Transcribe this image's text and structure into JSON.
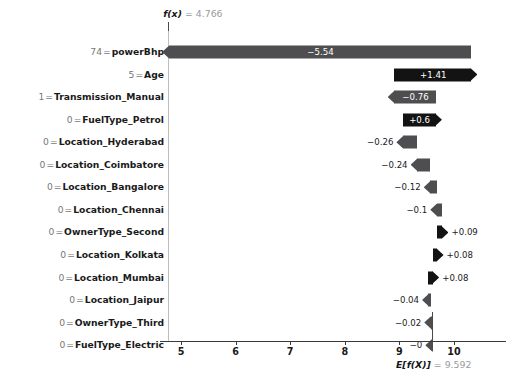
{
  "chart_data": {
    "type": "bar",
    "plot_kind": "shap-waterfall",
    "title": "",
    "xlabel": "",
    "ylabel": "",
    "xlim": [
      4.45,
      10.78
    ],
    "xticks": [
      5,
      6,
      7,
      8,
      9,
      10
    ],
    "xticklabels": [
      "5",
      "6",
      "7",
      "8",
      "9",
      "10"
    ],
    "grid": false,
    "legend": null,
    "base_value": 9.592,
    "base_value_annotation": {
      "key": "E[f(X)]",
      "eq": "=",
      "value": "9.592"
    },
    "output_value": 4.766,
    "output_value_annotation": {
      "key": "f(x)",
      "eq": "=",
      "value": "4.766"
    },
    "colors": {
      "positive": "#131313",
      "negative": "#4e4e50",
      "axis": "#3a3a3a",
      "reference_line": "#bdbdbd"
    },
    "categories": [
      "74 = powerBhp",
      "5 = Age",
      "1 = Transmission_Manual",
      "0 = FuelType_Petrol",
      "0 = Location_Hyderabad",
      "0 = Location_Coimbatore",
      "0 = Location_Bangalore",
      "0 = Location_Chennai",
      "0 = OwnerType_Second",
      "0 = Location_Kolkata",
      "0 = Location_Mumbai",
      "0 = Location_Jaipur",
      "0 = OwnerType_Third",
      "0 = FuelType_Electric"
    ],
    "values": [
      -5.54,
      1.41,
      -0.76,
      0.6,
      -0.26,
      -0.24,
      -0.12,
      -0.1,
      0.09,
      0.08,
      0.08,
      -0.04,
      -0.02,
      -0.0
    ]
  },
  "rows": [
    {
      "feature_value": "74",
      "eq": "=",
      "feature_name": "powerBhp",
      "value": -5.54,
      "value_label": "−5.54",
      "sign": "neg",
      "label_inside": true
    },
    {
      "feature_value": "5",
      "eq": "=",
      "feature_name": "Age",
      "value": 1.41,
      "value_label": "+1.41",
      "sign": "pos",
      "label_inside": true
    },
    {
      "feature_value": "1",
      "eq": "=",
      "feature_name": "Transmission_Manual",
      "value": -0.76,
      "value_label": "−0.76",
      "sign": "neg",
      "label_inside": true
    },
    {
      "feature_value": "0",
      "eq": "=",
      "feature_name": "FuelType_Petrol",
      "value": 0.6,
      "value_label": "+0.6",
      "sign": "pos",
      "label_inside": true
    },
    {
      "feature_value": "0",
      "eq": "=",
      "feature_name": "Location_Hyderabad",
      "value": -0.26,
      "value_label": "−0.26",
      "sign": "neg",
      "label_inside": false
    },
    {
      "feature_value": "0",
      "eq": "=",
      "feature_name": "Location_Coimbatore",
      "value": -0.24,
      "value_label": "−0.24",
      "sign": "neg",
      "label_inside": false
    },
    {
      "feature_value": "0",
      "eq": "=",
      "feature_name": "Location_Bangalore",
      "value": -0.12,
      "value_label": "−0.12",
      "sign": "neg",
      "label_inside": false
    },
    {
      "feature_value": "0",
      "eq": "=",
      "feature_name": "Location_Chennai",
      "value": -0.1,
      "value_label": "−0.1",
      "sign": "neg",
      "label_inside": false
    },
    {
      "feature_value": "0",
      "eq": "=",
      "feature_name": "OwnerType_Second",
      "value": 0.09,
      "value_label": "+0.09",
      "sign": "pos",
      "label_inside": false
    },
    {
      "feature_value": "0",
      "eq": "=",
      "feature_name": "Location_Kolkata",
      "value": 0.08,
      "value_label": "+0.08",
      "sign": "pos",
      "label_inside": false
    },
    {
      "feature_value": "0",
      "eq": "=",
      "feature_name": "Location_Mumbai",
      "value": 0.08,
      "value_label": "+0.08",
      "sign": "pos",
      "label_inside": false
    },
    {
      "feature_value": "0",
      "eq": "=",
      "feature_name": "Location_Jaipur",
      "value": -0.04,
      "value_label": "−0.04",
      "sign": "neg",
      "label_inside": false
    },
    {
      "feature_value": "0",
      "eq": "=",
      "feature_name": "OwnerType_Third",
      "value": -0.02,
      "value_label": "−0.02",
      "sign": "neg",
      "label_inside": false
    },
    {
      "feature_value": "0",
      "eq": "=",
      "feature_name": "FuelType_Electric",
      "value": -0.0,
      "value_label": "−0",
      "sign": "neg",
      "label_inside": false
    }
  ]
}
